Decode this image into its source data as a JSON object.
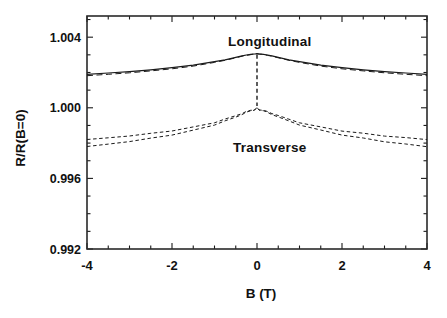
{
  "figure": {
    "background": "#ffffff",
    "ink": "#1a1a1a"
  },
  "chart_data": {
    "type": "line",
    "title": "",
    "xlabel": "B (T)",
    "ylabel": "R/R(B=0)",
    "xlim": [
      -4,
      4
    ],
    "ylim": [
      0.992,
      1.0052
    ],
    "grid": false,
    "legend_position": "none",
    "x_ticks": [
      -4,
      -2,
      0,
      2,
      4
    ],
    "x_tick_labels": [
      "-4",
      "-2",
      "0",
      "2",
      "4"
    ],
    "x_minor_step": 0.5,
    "y_ticks": [
      0.992,
      0.996,
      1.0,
      1.004
    ],
    "y_tick_labels": [
      "0.992",
      "0.996",
      "1.000",
      "1.004"
    ],
    "y_minor_step": 0.001,
    "annotations": [
      {
        "text": "Longitudinal",
        "x": 0.3,
        "y": 1.0038
      },
      {
        "text": "Transverse",
        "x": 0.3,
        "y": 0.9978
      }
    ],
    "series": [
      {
        "name": "longitudinal-solid",
        "style": "solid",
        "wobble": false,
        "x": [
          -4,
          -3.5,
          -3,
          -2.5,
          -2,
          -1.5,
          -1,
          -0.75,
          -0.5,
          -0.35,
          -0.25,
          -0.15,
          -0.1,
          -0.05,
          0,
          0.05,
          0.1,
          0.15,
          0.25,
          0.35,
          0.5,
          0.75,
          1,
          1.5,
          2,
          2.5,
          3,
          3.5,
          4
        ],
        "y": [
          1.0019,
          1.00197,
          1.00205,
          1.00215,
          1.00227,
          1.00241,
          1.00261,
          1.00272,
          1.00286,
          1.00294,
          1.00299,
          1.00303,
          1.00304,
          1.00305,
          1.00307,
          1.00305,
          1.00304,
          1.00303,
          1.00299,
          1.00294,
          1.00286,
          1.00272,
          1.00261,
          1.00241,
          1.00227,
          1.00215,
          1.00205,
          1.00197,
          1.0019
        ]
      },
      {
        "name": "longitudinal-dashed",
        "style": "dashed",
        "wobble": false,
        "x": [
          -4,
          -3.5,
          -3,
          -2.5,
          -2,
          -1.5,
          -1,
          -0.75,
          -0.5,
          -0.35,
          -0.25,
          -0.15,
          -0.1,
          -0.05,
          0,
          0.05,
          0.1,
          0.15,
          0.25,
          0.35,
          0.5,
          0.75,
          1,
          1.5,
          2,
          2.5,
          3,
          3.5,
          4
        ],
        "y": [
          1.00182,
          1.0019,
          1.00198,
          1.00209,
          1.00221,
          1.00236,
          1.00257,
          1.00269,
          1.00283,
          1.00292,
          1.00297,
          1.00301,
          1.00303,
          1.00304,
          1.00307,
          1.00304,
          1.00303,
          1.00301,
          1.00297,
          1.00292,
          1.00283,
          1.00269,
          1.00257,
          1.00236,
          1.00221,
          1.00209,
          1.00198,
          1.0019,
          1.00182
        ]
      },
      {
        "name": "transverse-dashed-upper",
        "style": "dashed",
        "wobble": true,
        "x": [
          -4,
          -3.5,
          -3,
          -2.5,
          -2,
          -1.5,
          -1,
          -0.75,
          -0.5,
          -0.35,
          -0.25,
          -0.15,
          -0.1,
          -0.05,
          0,
          0.05,
          0.1,
          0.15,
          0.25,
          0.35,
          0.5,
          0.75,
          1,
          1.5,
          2,
          2.5,
          3,
          3.5,
          4
        ],
        "y": [
          0.9982,
          0.9983,
          0.99841,
          0.99854,
          0.9987,
          0.9989,
          0.99917,
          0.99935,
          0.99955,
          0.99969,
          0.99978,
          0.99985,
          0.99988,
          0.99989,
          1.0,
          0.99989,
          0.99988,
          0.99985,
          0.99978,
          0.99969,
          0.99955,
          0.99935,
          0.99917,
          0.9989,
          0.9987,
          0.99854,
          0.99841,
          0.9983,
          0.9982
        ]
      },
      {
        "name": "transverse-dashed-lower",
        "style": "dashed",
        "wobble": true,
        "x": [
          -4,
          -3.5,
          -3,
          -2.5,
          -2,
          -1.5,
          -1,
          -0.75,
          -0.5,
          -0.35,
          -0.25,
          -0.15,
          -0.1,
          -0.05,
          0,
          0.05,
          0.1,
          0.15,
          0.25,
          0.35,
          0.5,
          0.75,
          1,
          1.5,
          2,
          2.5,
          3,
          3.5,
          4
        ],
        "y": [
          0.9978,
          0.99794,
          0.99809,
          0.99827,
          0.99847,
          0.99872,
          0.99904,
          0.99925,
          0.99947,
          0.99963,
          0.99974,
          0.99982,
          0.99986,
          0.99988,
          1.0,
          0.99988,
          0.99986,
          0.99982,
          0.99974,
          0.99963,
          0.99947,
          0.99925,
          0.99904,
          0.99872,
          0.99847,
          0.99827,
          0.99809,
          0.99794,
          0.9978
        ]
      }
    ],
    "zero_field_spike": {
      "x": 0,
      "y_from": 1.003,
      "y_to": 1.0001,
      "style": "dashed"
    }
  }
}
